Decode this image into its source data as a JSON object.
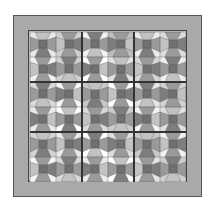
{
  "quilt": {
    "title": "Bow tie / snowball block quilt",
    "rows": 6,
    "cols": 6,
    "colors": {
      "outer_border": "#a9a9a9",
      "inner_field": "#b4b4b4",
      "sashing": "#333333",
      "center_dark": "#6e6e6e",
      "side_light": "#c2c2c2",
      "side_mid": "#9a9a9a",
      "side_dark": "#7d7d7d"
    },
    "corner_prints": [
      [
        "#e8e8e8",
        "#d0d0d0",
        "#f2f2f2",
        "#bdbdbd",
        "#ececec",
        "#dcdcdc"
      ],
      [
        "#f0f0f0",
        "#cfcfcf",
        "#ffffff",
        "#e2e2e2",
        "#d6d6d6",
        "#eeeeee"
      ],
      [
        "#dadada",
        "#f5f5f5",
        "#c8c8c8",
        "#ffffff",
        "#e6e6e6",
        "#d2d2d2"
      ],
      [
        "#eaeaea",
        "#ffffff",
        "#d9d9d9",
        "#cccccc",
        "#f3f3f3",
        "#e0e0e0"
      ],
      [
        "#d4d4d4",
        "#e9e9e9",
        "#ffffff",
        "#dedede",
        "#c9c9c9",
        "#f1f1f1"
      ],
      [
        "#f4f4f4",
        "#d8d8d8",
        "#ebebeb",
        "#ffffff",
        "#e4e4e4",
        "#cecece"
      ]
    ]
  }
}
